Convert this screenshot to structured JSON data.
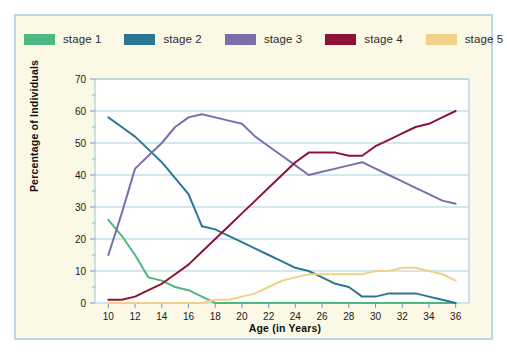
{
  "figure": {
    "background": "#ffffff",
    "panel_background": "#fbf8e6",
    "panel_border_color": "#b6d8e8",
    "plot_background": "#ffffff",
    "grid_color": "#a8cfe0"
  },
  "legend": {
    "position": "top",
    "items": [
      {
        "label": "stage 1",
        "color": "#4eb882"
      },
      {
        "label": "stage 2",
        "color": "#2c7695"
      },
      {
        "label": "stage 3",
        "color": "#7a6fa8"
      },
      {
        "label": "stage 4",
        "color": "#8e1136"
      },
      {
        "label": "stage 5",
        "color": "#f0d18a"
      }
    ]
  },
  "chart_data": {
    "type": "line",
    "title": "",
    "xlabel": "Age (in Years)",
    "ylabel": "Percentage of Individuals",
    "xlim": [
      9,
      37
    ],
    "ylim": [
      0,
      70
    ],
    "ytick_step": 10,
    "yminor_step": 5,
    "xticks": [
      10,
      12,
      14,
      16,
      18,
      20,
      22,
      24,
      26,
      28,
      30,
      32,
      34,
      36
    ],
    "yticks": [
      0,
      10,
      20,
      30,
      40,
      50,
      60,
      70
    ],
    "grid": "horizontal",
    "x": [
      10,
      11,
      12,
      13,
      14,
      15,
      16,
      17,
      18,
      19,
      20,
      21,
      22,
      23,
      24,
      25,
      26,
      27,
      28,
      29,
      30,
      31,
      32,
      33,
      34,
      35,
      36
    ],
    "series": [
      {
        "name": "stage 1",
        "color": "#4eb882",
        "values": [
          26,
          21,
          15,
          8,
          7,
          5,
          4,
          2,
          0,
          0,
          0,
          0,
          0,
          0,
          0,
          0,
          0,
          0,
          0,
          0,
          0,
          0,
          0,
          0,
          0,
          0,
          0
        ]
      },
      {
        "name": "stage 2",
        "color": "#2c7695",
        "values": [
          58,
          55,
          52,
          48,
          44,
          39,
          34,
          24,
          23,
          21,
          19,
          17,
          15,
          13,
          11,
          10,
          8,
          6,
          5,
          2,
          2,
          3,
          3,
          3,
          2,
          1,
          0
        ]
      },
      {
        "name": "stage 3",
        "color": "#7a6fa8",
        "values": [
          15,
          28,
          42,
          46,
          50,
          55,
          58,
          59,
          58,
          57,
          56,
          52,
          49,
          46,
          43,
          40,
          41,
          42,
          43,
          44,
          42,
          40,
          38,
          36,
          34,
          32,
          31
        ]
      },
      {
        "name": "stage 4",
        "color": "#8e1136",
        "values": [
          1,
          1,
          2,
          4,
          6,
          9,
          12,
          16,
          20,
          24,
          28,
          32,
          36,
          40,
          44,
          47,
          47,
          47,
          46,
          46,
          49,
          51,
          53,
          55,
          56,
          58,
          60
        ]
      },
      {
        "name": "stage 5",
        "color": "#f0d18a",
        "values": [
          0,
          0,
          0,
          0,
          0,
          0,
          0,
          0,
          1,
          1,
          2,
          3,
          5,
          7,
          8,
          9,
          9,
          9,
          9,
          9,
          10,
          10,
          11,
          11,
          10,
          9,
          7
        ]
      }
    ]
  }
}
